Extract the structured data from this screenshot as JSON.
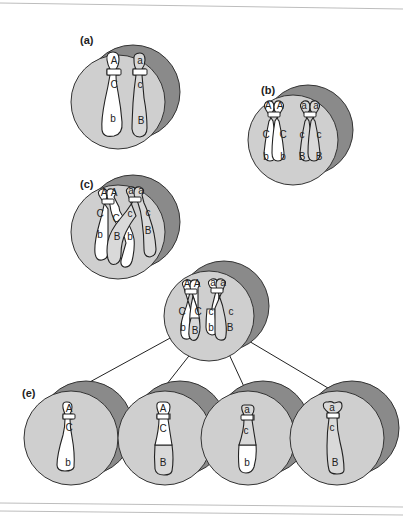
{
  "figure": {
    "colors": {
      "cell_front": "#cfcfcf",
      "cell_back": "#8a8a8a",
      "chromosome_light": "#ffffff",
      "chromosome_dark": "#d9d9d9",
      "outline": "#222222"
    },
    "panels": [
      {
        "id": "a",
        "label": "(a)",
        "chromosomes": [
          {
            "alleles": [
              "A",
              "C",
              "b"
            ]
          },
          {
            "alleles": [
              "a",
              "c",
              "B"
            ]
          }
        ]
      },
      {
        "id": "b",
        "label": "(b)",
        "chromosomes": [
          {
            "chromatids": [
              [
                "A",
                "C",
                "b"
              ],
              [
                "A",
                "C",
                "b"
              ]
            ]
          },
          {
            "chromatids": [
              [
                "a",
                "c",
                "B"
              ],
              [
                "a",
                "c",
                "B"
              ]
            ]
          }
        ]
      },
      {
        "id": "c",
        "label": "(c)",
        "chromosomes": [
          {
            "chromatids": [
              [
                "A",
                "C",
                "b"
              ],
              [
                "A",
                "C",
                "B"
              ]
            ]
          },
          {
            "chromatids": [
              [
                "a",
                "c",
                "b"
              ],
              [
                "a",
                "c",
                "B"
              ]
            ]
          }
        ],
        "note": "crossing over between inner chromatids"
      },
      {
        "id": "d",
        "label": "(d)",
        "chromosomes": [
          {
            "chromatids": [
              [
                "A",
                "C",
                "b"
              ],
              [
                "A",
                "C",
                "B"
              ]
            ]
          },
          {
            "chromatids": [
              [
                "a",
                "c",
                "b"
              ],
              [
                "a",
                "c",
                "B"
              ]
            ]
          }
        ]
      },
      {
        "id": "e",
        "label": "(e)",
        "cells": [
          {
            "alleles": [
              "A",
              "C",
              "b"
            ]
          },
          {
            "alleles": [
              "A",
              "C",
              "B"
            ]
          },
          {
            "alleles": [
              "a",
              "c",
              "b"
            ]
          },
          {
            "alleles": [
              "a",
              "c",
              "B"
            ]
          }
        ]
      }
    ]
  },
  "labels": {
    "a": "(a)",
    "b": "(b)",
    "c": "(c)",
    "d": "(d)",
    "e": "(e)"
  },
  "genes": {
    "A": "A",
    "a": "a",
    "B": "B",
    "b": "b",
    "C": "C",
    "c": "c"
  }
}
